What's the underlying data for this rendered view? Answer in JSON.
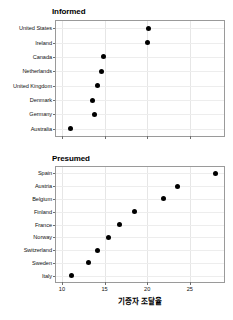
{
  "chart_data": {
    "type": "scatter",
    "title": "",
    "xlabel": "기증자 조달율",
    "ylabel": "",
    "xlim": [
      9.3,
      29.0
    ],
    "xticks": [
      10,
      15,
      20,
      25
    ],
    "xtick_labels": [
      "10",
      "15",
      "20",
      "25"
    ],
    "grid": true,
    "legend": null,
    "panels": [
      {
        "title": "Informed",
        "categories": [
          "United States",
          "Ireland",
          "Canada",
          "Netherlands",
          "United Kingdom",
          "Denmark",
          "Germany",
          "Australia"
        ],
        "values": [
          20.1,
          20.0,
          14.9,
          14.6,
          14.2,
          13.6,
          13.8,
          11.0
        ]
      },
      {
        "title": "Presumed",
        "categories": [
          "Spain",
          "Austria",
          "Belgium",
          "Finland",
          "France",
          "Norway",
          "Switzerland",
          "Sweden",
          "Italy"
        ],
        "values": [
          28.0,
          23.6,
          21.9,
          18.5,
          16.8,
          15.4,
          14.2,
          13.1,
          11.1
        ]
      }
    ]
  },
  "axis": {
    "x_title": "기증자 조달율",
    "tick_labels": [
      "10",
      "15",
      "20",
      "25"
    ]
  },
  "panel_titles": {
    "informed": "Informed",
    "presumed": "Presumed"
  },
  "colors": {
    "point": "#000000",
    "grid": "#e6e6e6",
    "frame": "#9a9a9a",
    "text": "#111111",
    "background": "#ffffff"
  }
}
